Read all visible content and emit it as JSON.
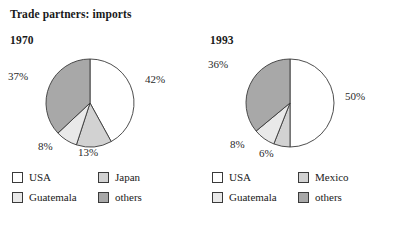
{
  "title": "Trade partners: imports",
  "colors": {
    "usa": "#ffffff",
    "guatemala": "#e9e9e9",
    "third": "#d2d2d2",
    "others": "#a8a8a8",
    "outline": "#3a3a3a",
    "text": "#1a1a1a"
  },
  "chart_data": [
    {
      "type": "pie",
      "title": "1970",
      "labels": [
        "USA",
        "Japan",
        "Guatemala",
        "others"
      ],
      "values": [
        42,
        13,
        8,
        37
      ],
      "value_labels": [
        "42%",
        "13%",
        "8%",
        "37%"
      ],
      "colors": [
        "#ffffff",
        "#d2d2d2",
        "#e9e9e9",
        "#a8a8a8"
      ],
      "start_angle": 0,
      "direction": "clockwise",
      "legend_position": "bottom",
      "legend": [
        {
          "label": "USA",
          "color": "#ffffff"
        },
        {
          "label": "Japan",
          "color": "#d2d2d2"
        },
        {
          "label": "Guatemala",
          "color": "#e9e9e9"
        },
        {
          "label": "others",
          "color": "#a8a8a8"
        }
      ]
    },
    {
      "type": "pie",
      "title": "1993",
      "labels": [
        "USA",
        "Mexico",
        "Guatemala",
        "others"
      ],
      "values": [
        50,
        6,
        8,
        36
      ],
      "value_labels": [
        "50%",
        "6%",
        "8%",
        "36%"
      ],
      "colors": [
        "#ffffff",
        "#d2d2d2",
        "#e9e9e9",
        "#a8a8a8"
      ],
      "start_angle": 0,
      "direction": "clockwise",
      "legend_position": "bottom",
      "legend": [
        {
          "label": "USA",
          "color": "#ffffff"
        },
        {
          "label": "Mexico",
          "color": "#d2d2d2"
        },
        {
          "label": "Guatemala",
          "color": "#e9e9e9"
        },
        {
          "label": "others",
          "color": "#a8a8a8"
        }
      ]
    }
  ],
  "panels": [
    {
      "year": "1970",
      "pct": {
        "usa": "42%",
        "third": "13%",
        "guatemala": "8%",
        "others": "37%"
      },
      "legend": {
        "usa": "USA",
        "guatemala": "Guatemala",
        "third": "Japan",
        "others": "others"
      }
    },
    {
      "year": "1993",
      "pct": {
        "usa": "50%",
        "third": "6%",
        "guatemala": "8%",
        "others": "36%"
      },
      "legend": {
        "usa": "USA",
        "guatemala": "Guatemala",
        "third": "Mexico",
        "others": "others"
      }
    }
  ]
}
